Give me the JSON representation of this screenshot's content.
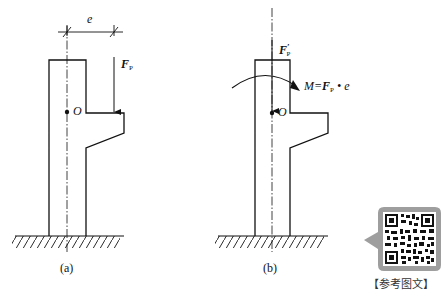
{
  "figure_a": {
    "caption": "(a)",
    "dimension_label": "e",
    "force_label": "F",
    "force_subscript": "P",
    "point_label": "O"
  },
  "figure_b": {
    "caption": "(b)",
    "force_label": "F",
    "force_prime": "′",
    "force_subscript": "P",
    "moment_label_prefix": "M=",
    "moment_label_force": "F",
    "moment_label_subscript": "P",
    "moment_label_suffix": " • e",
    "point_label": "O"
  },
  "qr": {
    "caption": "【参考图文】",
    "background": "#9e9e9e"
  },
  "colors": {
    "line": "#111111",
    "background": "#ffffff"
  }
}
